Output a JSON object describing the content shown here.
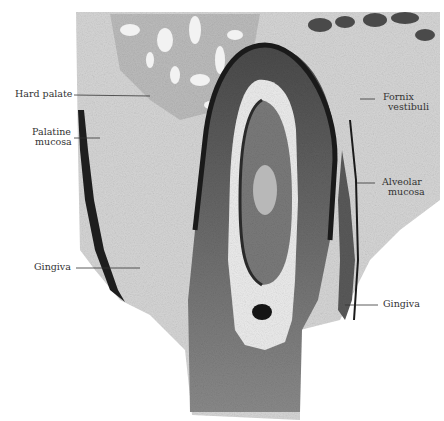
{
  "figure": {
    "type": "histological section",
    "background": "#ffffff",
    "tissue_colors": {
      "light_tissue": "#d8d8d8",
      "mid_tissue": "#9a9a9a",
      "dark_tissue": "#3a3a3a",
      "epithelium_edge": "#1a1a1a"
    }
  },
  "labels": {
    "hard_palate": "Hard palate",
    "palatine_mucosa_1": "Palatine",
    "palatine_mucosa_2": "mucosa",
    "gingiva_left": "Gingiva",
    "fornix_vestibuli_1": "Fornix",
    "fornix_vestibuli_2": "vestibuli",
    "alveolar_mucosa_1": "Alveolar",
    "alveolar_mucosa_2": "mucosa",
    "gingiva_right": "Gingiva"
  }
}
